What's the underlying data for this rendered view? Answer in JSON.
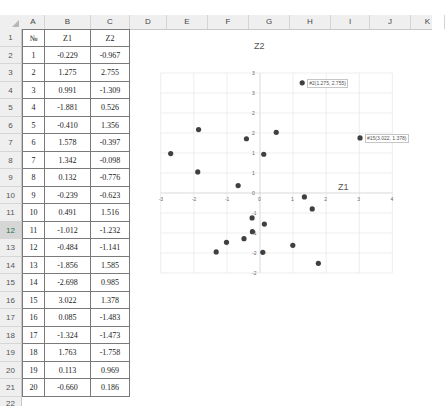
{
  "spreadsheet": {
    "columns": [
      "A",
      "B",
      "C",
      "D",
      "E",
      "F",
      "G",
      "H",
      "I",
      "J",
      "K"
    ],
    "selected_row": 12,
    "row_numbers": [
      1,
      2,
      3,
      4,
      5,
      6,
      7,
      8,
      9,
      10,
      11,
      12,
      13,
      14,
      15,
      16,
      17,
      18,
      19,
      20,
      21,
      22
    ],
    "header_row": [
      "№",
      "Z1",
      "Z2"
    ],
    "rows": [
      [
        "1",
        "-0.229",
        "-0.967"
      ],
      [
        "2",
        "1.275",
        "2.755"
      ],
      [
        "3",
        "0.991",
        "-1.309"
      ],
      [
        "4",
        "-1.881",
        "0.526"
      ],
      [
        "5",
        "-0.410",
        "1.356"
      ],
      [
        "6",
        "1.578",
        "-0.397"
      ],
      [
        "7",
        "1.342",
        "-0.098"
      ],
      [
        "8",
        "0.132",
        "-0.776"
      ],
      [
        "9",
        "-0.239",
        "-0.623"
      ],
      [
        "10",
        "0.491",
        "1.516"
      ],
      [
        "11",
        "-1.012",
        "-1.232"
      ],
      [
        "12",
        "-0.484",
        "-1.141"
      ],
      [
        "13",
        "-1.856",
        "1.585"
      ],
      [
        "14",
        "-2.698",
        "0.985"
      ],
      [
        "15",
        "3.022",
        "1.378"
      ],
      [
        "16",
        "0.085",
        "-1.483"
      ],
      [
        "17",
        "-1.324",
        "-1.473"
      ],
      [
        "18",
        "1.763",
        "-1.758"
      ],
      [
        "19",
        "0.113",
        "0.969"
      ],
      [
        "20",
        "-0.660",
        "0.186"
      ]
    ]
  },
  "chart_data": {
    "type": "scatter",
    "title": "Z2",
    "xlabel": "Z1",
    "ylabel": "",
    "xlim": [
      -3,
      4
    ],
    "ylim": [
      -2,
      3
    ],
    "x_ticks": [
      "-3",
      "-2",
      "-1",
      "0",
      "1",
      "2",
      "3",
      "4"
    ],
    "y_ticks": [
      "3",
      "3",
      "2",
      "2",
      "1",
      "1",
      "0",
      "-1",
      "-1",
      "-2",
      "-2"
    ],
    "y_tick_values": [
      3,
      2.5,
      2,
      1.5,
      1,
      0.5,
      0,
      -0.5,
      -1,
      -1.5,
      -2
    ],
    "grid": true,
    "legend": "none",
    "marker_color": "#404040",
    "points": [
      {
        "x": -0.229,
        "y": -0.967
      },
      {
        "x": 1.275,
        "y": 2.755
      },
      {
        "x": 0.991,
        "y": -1.309
      },
      {
        "x": -1.881,
        "y": 0.526
      },
      {
        "x": -0.41,
        "y": 1.356
      },
      {
        "x": 1.578,
        "y": -0.397
      },
      {
        "x": 1.342,
        "y": -0.098
      },
      {
        "x": 0.132,
        "y": -0.776
      },
      {
        "x": -0.239,
        "y": -0.623
      },
      {
        "x": 0.491,
        "y": 1.516
      },
      {
        "x": -1.012,
        "y": -1.232
      },
      {
        "x": -0.484,
        "y": -1.141
      },
      {
        "x": -1.856,
        "y": 1.585
      },
      {
        "x": -2.698,
        "y": 0.985
      },
      {
        "x": 3.022,
        "y": 1.378
      },
      {
        "x": 0.085,
        "y": -1.483
      },
      {
        "x": -1.324,
        "y": -1.473
      },
      {
        "x": 1.763,
        "y": -1.758
      },
      {
        "x": 0.113,
        "y": 0.969
      },
      {
        "x": -0.66,
        "y": 0.186
      }
    ],
    "annotations": [
      {
        "point_index": 1,
        "text": "#2(1.275, 2.755)"
      },
      {
        "point_index": 14,
        "text": "#15(3.022, 1.378)"
      }
    ]
  }
}
